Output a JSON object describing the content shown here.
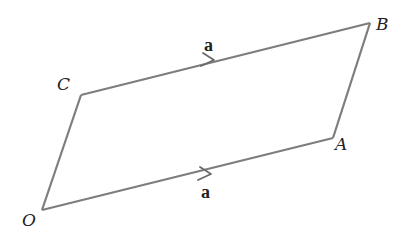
{
  "diagram": {
    "type": "parallelogram",
    "colors": {
      "edge": "#7d7d7d",
      "text": "#222222",
      "background": "#ffffff"
    },
    "vertices": {
      "O": {
        "label": "O",
        "x": 42,
        "y": 210
      },
      "A": {
        "label": "A",
        "x": 333,
        "y": 138
      },
      "B": {
        "label": "B",
        "x": 370,
        "y": 23
      },
      "C": {
        "label": "C",
        "x": 81,
        "y": 95
      }
    },
    "edges": [
      {
        "from": "O",
        "to": "A",
        "arrow": true,
        "vector_label": "a"
      },
      {
        "from": "A",
        "to": "B",
        "arrow": false
      },
      {
        "from": "B",
        "to": "C",
        "arrow": false
      },
      {
        "from": "C",
        "to": "B",
        "arrow": true,
        "vector_label": "a"
      },
      {
        "from": "O",
        "to": "C",
        "arrow": false
      }
    ],
    "labels": {
      "O": "O",
      "A": "A",
      "B": "B",
      "C": "C",
      "vector_top": "a",
      "vector_bottom": "a"
    }
  }
}
